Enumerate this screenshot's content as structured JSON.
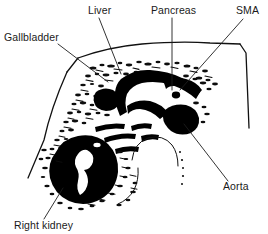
{
  "figure": {
    "kind": "anatomical-line-drawing",
    "background_color": "#ffffff",
    "ink_color": "#000000",
    "label_color": "#1a1a1a"
  },
  "labels": [
    {
      "id": "gallbladder",
      "text": "Gallbladder",
      "text_x": 4,
      "text_y": 41,
      "anchor": "start",
      "leader": "M 58 44 L 108 82",
      "leader_name": "gallbladder-leader-line"
    },
    {
      "id": "liver",
      "text": "Liver",
      "text_x": 88,
      "text_y": 14,
      "anchor": "start",
      "leader": "M 99 18 L 121 74",
      "leader_name": "liver-leader-line"
    },
    {
      "id": "pancreas",
      "text": "Pancreas",
      "text_x": 151,
      "text_y": 14,
      "anchor": "start",
      "leader": "M 172 18 L 172 90",
      "leader_name": "pancreas-leader-line"
    },
    {
      "id": "sma",
      "text": "SMA",
      "text_x": 236,
      "text_y": 14,
      "anchor": "start",
      "leader": "M 243 19 L 182 88",
      "leader_name": "sma-leader-line"
    },
    {
      "id": "aorta",
      "text": "Aorta",
      "text_x": 223,
      "text_y": 190,
      "anchor": "start",
      "leader": "M 228 181 L 183 124",
      "leader_name": "aorta-leader-line"
    },
    {
      "id": "right-kidney",
      "text": "Right kidney",
      "text_x": 14,
      "text_y": 229,
      "anchor": "start",
      "leader": "M 44 219 L 63 188",
      "leader_name": "right-kidney-leader-line"
    }
  ],
  "outlines": {
    "body_wall": "M 80 57 Q 140 40 196 42 L 241 44 L 247 129",
    "body_wall_left": "M 80 57 L 68 74 Q 50 112 44 142",
    "sector_left_edge": "M 44 142 L 27 176",
    "spine_arc": "M 140 148 Q 152 133 166 140 Q 176 147 178 162"
  }
}
